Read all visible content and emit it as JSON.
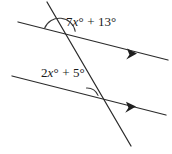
{
  "figure": {
    "type": "geometry-diagram",
    "background_color": "#ffffff",
    "line_color": "#2b2b2b",
    "text_color": "#1a1a1a",
    "labels": {
      "top_angle": "7x° + 13°",
      "bottom_angle": "2x° + 5°"
    },
    "elements": {
      "parallel_line_upper": "upper parallel line with single arrowhead",
      "parallel_line_lower": "lower parallel line with single arrowhead",
      "transversal": "transversal line crossing both parallel lines",
      "arc_upper": "angle arc at upper intersection",
      "arc_lower": "angle arc at lower intersection"
    }
  }
}
